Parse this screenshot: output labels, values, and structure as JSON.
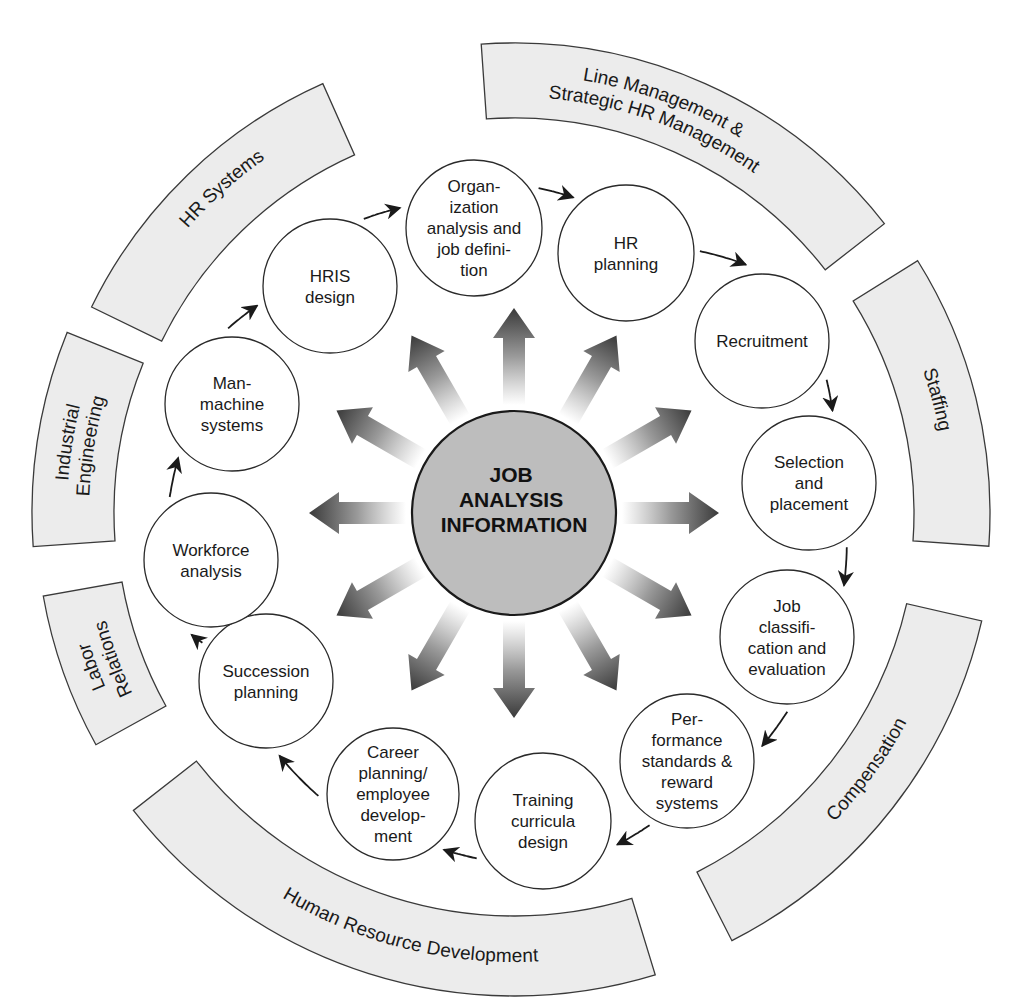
{
  "diagram": {
    "center": {
      "x": 514,
      "y": 513
    },
    "core": {
      "label_lines": [
        "JOB",
        "ANALYSIS",
        "INFORMATION"
      ],
      "radius": 102,
      "fill": "#bdbdbd"
    },
    "colors": {
      "band_fill": "#ececec",
      "stroke": "#2a2a2a",
      "arrow_dark": "#3a3a3a",
      "arrow_light": "#ffffff"
    },
    "radiating_arrows": {
      "count": 12,
      "angles_deg": [
        -90,
        -60,
        -30,
        0,
        30,
        60,
        90,
        120,
        150,
        180,
        210,
        240
      ],
      "start_radius": 108,
      "end_radius": 205
    },
    "flow_direction": "clockwise",
    "nodes": [
      {
        "id": "org-analysis",
        "lines": [
          "Organ-",
          "ization",
          "analysis and",
          "job defini-",
          "tion"
        ],
        "x": 474,
        "y": 228,
        "r": 68
      },
      {
        "id": "hr-planning",
        "lines": [
          "HR",
          "planning"
        ],
        "x": 626,
        "y": 253,
        "r": 68
      },
      {
        "id": "recruitment",
        "lines": [
          "Recruitment"
        ],
        "x": 762,
        "y": 341,
        "r": 67
      },
      {
        "id": "selection-placement",
        "lines": [
          "Selection",
          "and",
          "placement"
        ],
        "x": 809,
        "y": 483,
        "r": 67
      },
      {
        "id": "job-classification",
        "lines": [
          "Job",
          "classifi-",
          "cation and",
          "evaluation"
        ],
        "x": 787,
        "y": 637,
        "r": 67
      },
      {
        "id": "performance-standards",
        "lines": [
          "Per-",
          "formance",
          "standards &",
          "reward",
          "systems"
        ],
        "x": 687,
        "y": 761,
        "r": 67
      },
      {
        "id": "training-curricula",
        "lines": [
          "Training",
          "curricula",
          "design"
        ],
        "x": 543,
        "y": 821,
        "r": 68
      },
      {
        "id": "career-planning",
        "lines": [
          "Career",
          "planning/",
          "employee",
          "develop-",
          "ment"
        ],
        "x": 393,
        "y": 794,
        "r": 66
      },
      {
        "id": "succession-planning",
        "lines": [
          "Succession",
          "planning"
        ],
        "x": 266,
        "y": 681,
        "r": 67
      },
      {
        "id": "workforce-analysis",
        "lines": [
          "Workforce",
          "analysis"
        ],
        "x": 211,
        "y": 560,
        "r": 67
      },
      {
        "id": "man-machine",
        "lines": [
          "Man-",
          "machine",
          "systems"
        ],
        "x": 232,
        "y": 404,
        "r": 67
      },
      {
        "id": "hris-design",
        "lines": [
          "HRIS",
          "design"
        ],
        "x": 330,
        "y": 286,
        "r": 67
      }
    ],
    "bands": [
      {
        "id": "hr-systems",
        "lines": [
          "HR Systems"
        ],
        "start_deg": 206,
        "end_deg": 246,
        "r_in": 392,
        "r_out": 470,
        "label_deg": 228,
        "label_r": 438,
        "flip": false
      },
      {
        "id": "line-management",
        "lines": [
          "Line Management &",
          "Strategic HR Management"
        ],
        "start_deg": 266,
        "end_deg": 322,
        "r_in": 395,
        "r_out": 470,
        "label_deg": 290,
        "label_r": 432,
        "flip": false
      },
      {
        "id": "staffing",
        "lines": [
          "Staffing"
        ],
        "start_deg": 328,
        "end_deg": 364,
        "r_in": 400,
        "r_out": 476,
        "label_deg": 345,
        "label_r": 438,
        "flip": false
      },
      {
        "id": "compensation",
        "lines": [
          "Compensation"
        ],
        "start_deg": 13,
        "end_deg": 63,
        "r_in": 403,
        "r_out": 480,
        "label_deg": 36,
        "label_r": 440,
        "flip": true
      },
      {
        "id": "human-resource-development",
        "lines": [
          "Human      Resource      Development"
        ],
        "start_deg": 73,
        "end_deg": 142,
        "r_in": 403,
        "r_out": 483,
        "label_deg": 104,
        "label_r": 444,
        "flip": true
      },
      {
        "id": "labor-relations",
        "lines": [
          "Labor",
          "Relations"
        ],
        "start_deg": 151,
        "end_deg": 170,
        "r_in": 398,
        "r_out": 478,
        "label_deg": 160,
        "label_r": 438,
        "flip": false
      },
      {
        "id": "industrial-engineering",
        "lines": [
          "Industrial",
          "Engineering"
        ],
        "start_deg": 176,
        "end_deg": 202,
        "r_in": 400,
        "r_out": 482,
        "label_deg": 189,
        "label_r": 441,
        "flip": false
      }
    ]
  }
}
